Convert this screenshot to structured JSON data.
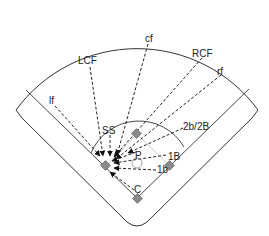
{
  "diagram": {
    "type": "baseball-field-throw-diagram",
    "colors": {
      "line": "#333333",
      "base_fill": "#8a8a8a",
      "base_stroke": "#555555",
      "background": "#ffffff"
    },
    "target_base": "3B",
    "labels": {
      "lf": "lf",
      "lcf": "LCF",
      "cf": "cf",
      "rcf": "RCF",
      "rf": "rf",
      "ss": "SS",
      "second": "2b/2B",
      "pitcher": "P",
      "first_upper": "1B",
      "first_lower": "1b",
      "catcher": "C"
    },
    "throws": [
      {
        "from": "lf",
        "to": "3B"
      },
      {
        "from": "LCF",
        "to": "3B"
      },
      {
        "from": "cf",
        "to": "3B"
      },
      {
        "from": "RCF",
        "to": "3B"
      },
      {
        "from": "rf",
        "to": "3B"
      },
      {
        "from": "SS",
        "to": "3B"
      },
      {
        "from": "2b/2B",
        "to": "3B"
      },
      {
        "from": "P",
        "to": "3B"
      },
      {
        "from": "1B",
        "to": "3B"
      },
      {
        "from": "1b",
        "to": "3B"
      },
      {
        "from": "C",
        "to": "3B"
      }
    ]
  }
}
